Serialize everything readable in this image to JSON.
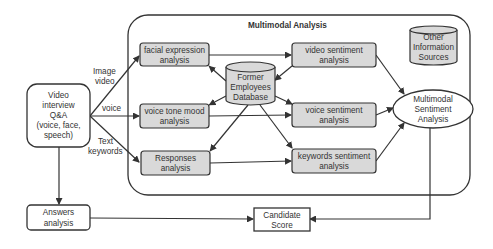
{
  "container": {
    "title": "Multimodal Analysis"
  },
  "nodes": {
    "video_interview": [
      "Video",
      "interview",
      "Q&A",
      "(voice, face,",
      "speech)"
    ],
    "facial_expression": [
      "facial expression",
      "analysis"
    ],
    "voice_tone": [
      "voice tone mood",
      "analysis"
    ],
    "responses": [
      "Responses",
      "analysis"
    ],
    "database": [
      "Former",
      "Employees",
      "Database"
    ],
    "video_sentiment": [
      "video sentiment",
      "analysis"
    ],
    "voice_sentiment": [
      "voice sentiment",
      "analysis"
    ],
    "keywords_sentiment": [
      "keywords sentiment",
      "analysis"
    ],
    "other_sources": [
      "Other",
      "Information",
      "Sources"
    ],
    "multimodal_sentiment": [
      "Multimodal",
      "Sentiment",
      "Analysis"
    ],
    "answers_analysis": [
      "Answers",
      "analysis"
    ],
    "candidate_score": [
      "Candidate",
      "Score"
    ]
  },
  "edge_labels": {
    "image_video": [
      "Image",
      "video"
    ],
    "voice": [
      "voice"
    ],
    "text_keywords": [
      "Text",
      "keywords"
    ]
  },
  "colors": {
    "box_fill": "#d9d9d9",
    "stroke": "#333333",
    "background": "#ffffff"
  }
}
